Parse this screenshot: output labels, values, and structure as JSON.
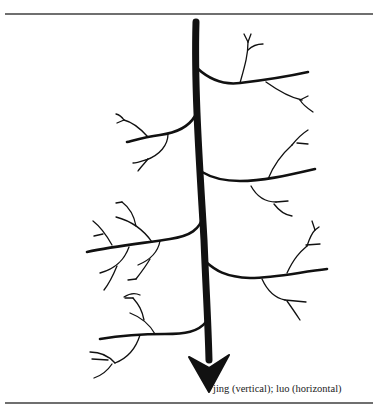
{
  "figure": {
    "caption": "jing (vertical); luo (horizontal)",
    "elements": {
      "trunk": {
        "label": "jing",
        "orientation": "vertical",
        "direction": "downward arrow"
      },
      "branches": {
        "label": "luo",
        "orientation": "horizontal",
        "count": 6,
        "sides": [
          "right",
          "left",
          "right",
          "left",
          "right",
          "left"
        ]
      }
    },
    "colors": {
      "ink": "#111111",
      "rule": "#6f6f6f",
      "background": "#ffffff"
    }
  }
}
